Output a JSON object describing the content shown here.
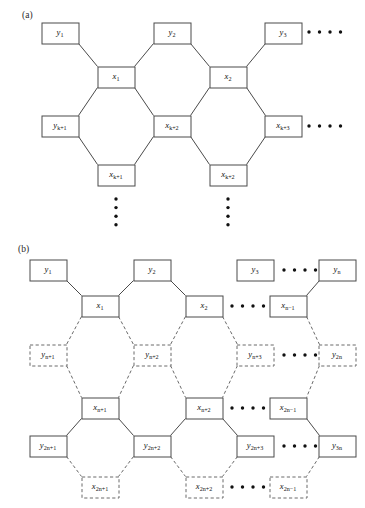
{
  "figure": {
    "panels": [
      {
        "id": "a",
        "label": "(a)",
        "nodes": [
          {
            "name": "y1",
            "base": "y",
            "sub": "1",
            "style": "solid",
            "x": 60,
            "y": 33
          },
          {
            "name": "y2",
            "base": "y",
            "sub": "2",
            "style": "solid",
            "x": 172,
            "y": 33
          },
          {
            "name": "y3",
            "base": "y",
            "sub": "3",
            "style": "solid",
            "x": 283,
            "y": 33
          },
          {
            "name": "x1",
            "base": "x",
            "sub": "1",
            "style": "solid",
            "x": 116,
            "y": 77
          },
          {
            "name": "x2",
            "base": "x",
            "sub": "2",
            "style": "solid",
            "x": 228,
            "y": 77
          },
          {
            "name": "yk1",
            "base": "y",
            "sub": "k+1",
            "style": "solid",
            "x": 60,
            "y": 126
          },
          {
            "name": "xk2",
            "base": "x",
            "sub": "k+2",
            "style": "solid",
            "x": 172,
            "y": 126
          },
          {
            "name": "xk3",
            "base": "x",
            "sub": "k+3",
            "style": "solid",
            "x": 283,
            "y": 126
          },
          {
            "name": "xk1",
            "base": "x",
            "sub": "k+1",
            "style": "solid",
            "x": 116,
            "y": 175
          },
          {
            "name": "xk2b",
            "base": "x",
            "sub": "k+2",
            "style": "solid",
            "x": 228,
            "y": 175
          }
        ],
        "ellipses_h": [
          {
            "name": "row-y-dots",
            "x": 325,
            "y": 32
          },
          {
            "name": "row-mid-dots",
            "x": 325,
            "y": 126
          }
        ],
        "ellipses_v": [
          {
            "name": "col1-dots",
            "x": 116,
            "y": 212
          },
          {
            "name": "col2-dots",
            "x": 228,
            "y": 212
          }
        ]
      },
      {
        "id": "b",
        "label": "(b)",
        "nodes": [
          {
            "name": "y1",
            "base": "y",
            "sub": "1",
            "style": "solid",
            "x": 48,
            "y": 270
          },
          {
            "name": "y2",
            "base": "y",
            "sub": "2",
            "style": "solid",
            "x": 152,
            "y": 270
          },
          {
            "name": "y3",
            "base": "y",
            "sub": "3",
            "style": "solid",
            "x": 255,
            "y": 270
          },
          {
            "name": "yn",
            "base": "y",
            "sub": "n",
            "style": "solid",
            "x": 337,
            "y": 270
          },
          {
            "name": "x1",
            "base": "x",
            "sub": "1",
            "style": "solid",
            "x": 100,
            "y": 306
          },
          {
            "name": "x2",
            "base": "x",
            "sub": "2",
            "style": "solid",
            "x": 204,
            "y": 306
          },
          {
            "name": "xn1",
            "base": "x",
            "sub": "n−1",
            "style": "solid",
            "x": 288,
            "y": 306
          },
          {
            "name": "yn1",
            "base": "y",
            "sub": "n+1",
            "style": "dashed",
            "x": 48,
            "y": 355
          },
          {
            "name": "yn2",
            "base": "y",
            "sub": "n+2",
            "style": "dashed",
            "x": 152,
            "y": 355
          },
          {
            "name": "yn3",
            "base": "y",
            "sub": "n+3",
            "style": "dashed",
            "x": 255,
            "y": 355
          },
          {
            "name": "y2n",
            "base": "y",
            "sub": "2n",
            "style": "dashed",
            "x": 337,
            "y": 355
          },
          {
            "name": "xn1b",
            "base": "x",
            "sub": "n+1",
            "style": "solid",
            "x": 100,
            "y": 408
          },
          {
            "name": "xn2",
            "base": "x",
            "sub": "n+2",
            "style": "solid",
            "x": 204,
            "y": 408
          },
          {
            "name": "x2n1",
            "base": "x",
            "sub": "2n−1",
            "style": "solid",
            "x": 288,
            "y": 408
          },
          {
            "name": "y2n1",
            "base": "y",
            "sub": "2n+1",
            "style": "solid",
            "x": 48,
            "y": 446
          },
          {
            "name": "y2n2",
            "base": "y",
            "sub": "2n+2",
            "style": "solid",
            "x": 152,
            "y": 446
          },
          {
            "name": "y2n3",
            "base": "y",
            "sub": "2n+3",
            "style": "solid",
            "x": 255,
            "y": 446
          },
          {
            "name": "y3n",
            "base": "y",
            "sub": "3n",
            "style": "solid",
            "x": 337,
            "y": 446
          },
          {
            "name": "x2n1b",
            "base": "x",
            "sub": "2n+1",
            "style": "dashed",
            "x": 100,
            "y": 487
          },
          {
            "name": "x2n2",
            "base": "x",
            "sub": "2n+2",
            "style": "dashed",
            "x": 204,
            "y": 487
          },
          {
            "name": "x2n1c",
            "base": "x",
            "sub": "2n−1",
            "style": "dashed",
            "x": 288,
            "y": 487
          }
        ],
        "ellipses_h": [
          {
            "name": "row1-dots",
            "x": 300,
            "y": 270
          },
          {
            "name": "row2-dots",
            "x": 248,
            "y": 306
          },
          {
            "name": "row3-dots",
            "x": 300,
            "y": 355
          },
          {
            "name": "row4-dots",
            "x": 248,
            "y": 408
          },
          {
            "name": "row5-dots",
            "x": 300,
            "y": 446
          },
          {
            "name": "row6-dots",
            "x": 248,
            "y": 487
          }
        ]
      }
    ],
    "box": {
      "w": 37,
      "h": 21
    },
    "colors": {
      "line_solid": "#4a4a4a",
      "line_dashed": "#6a6a6a",
      "text": "#111111",
      "background": "#ffffff"
    }
  }
}
